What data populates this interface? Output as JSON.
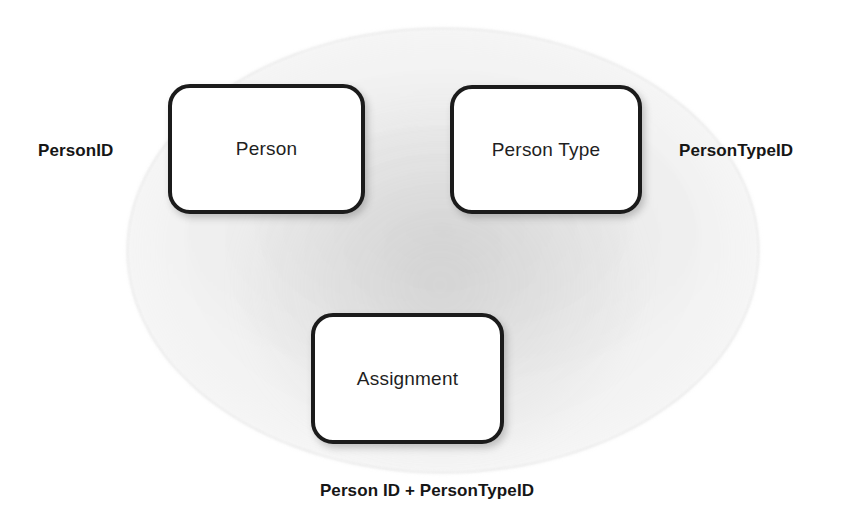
{
  "diagram": {
    "background_color": "#ffffff",
    "box_border_color": "#1b1b1b",
    "box_fill_color": "#ffffff",
    "text_color": "#1f1f1f",
    "ellipse_fill_color": "#f0f0f0",
    "entities": [
      {
        "id": "person",
        "label": "Person"
      },
      {
        "id": "person_type",
        "label": "Person Type"
      },
      {
        "id": "assignment",
        "label": "Assignment"
      }
    ],
    "keys": [
      {
        "id": "person_id",
        "label": "PersonID",
        "position": "left"
      },
      {
        "id": "person_type_id",
        "label": "PersonTypeID",
        "position": "right"
      },
      {
        "id": "composite_key",
        "label": "Person ID + PersonTypeID",
        "position": "bottom"
      }
    ]
  }
}
